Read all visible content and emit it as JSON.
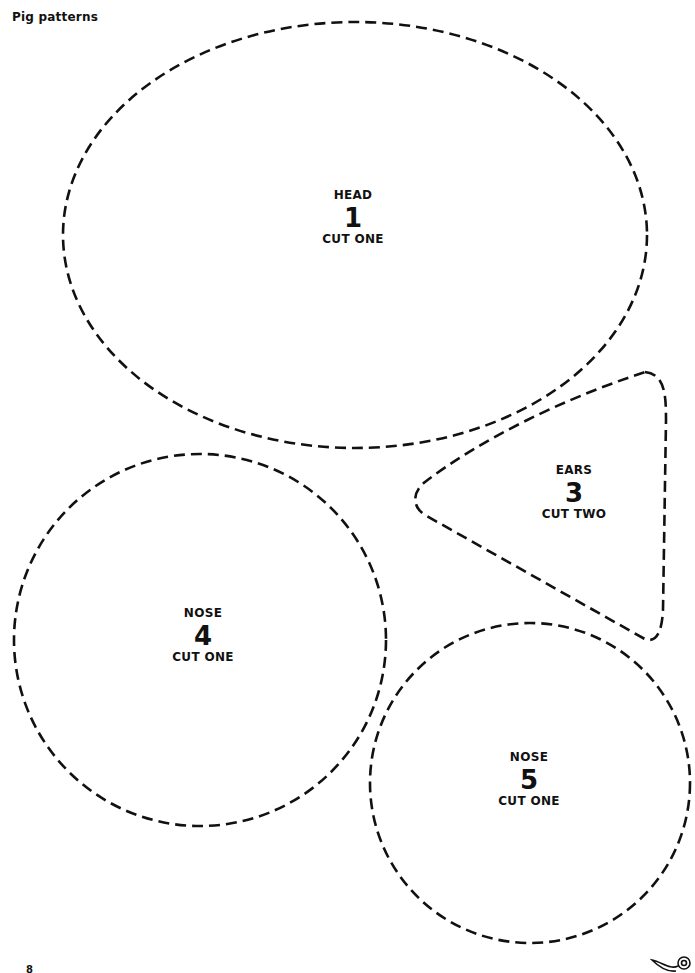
{
  "page": {
    "title": "Pig patterns",
    "page_number": "8"
  },
  "pieces": [
    {
      "name": "HEAD",
      "number": "1",
      "instruction": "CUT ONE",
      "shape": "ellipse"
    },
    {
      "name": "EARS",
      "number": "3",
      "instruction": "CUT TWO",
      "shape": "rounded-triangle"
    },
    {
      "name": "NOSE",
      "number": "4",
      "instruction": "CUT ONE",
      "shape": "circle"
    },
    {
      "name": "NOSE",
      "number": "5",
      "instruction": "CUT ONE",
      "shape": "circle"
    }
  ],
  "icons": {
    "scissors": "scissors-icon"
  },
  "colors": {
    "ink": "#111111",
    "paper": "#ffffff"
  }
}
